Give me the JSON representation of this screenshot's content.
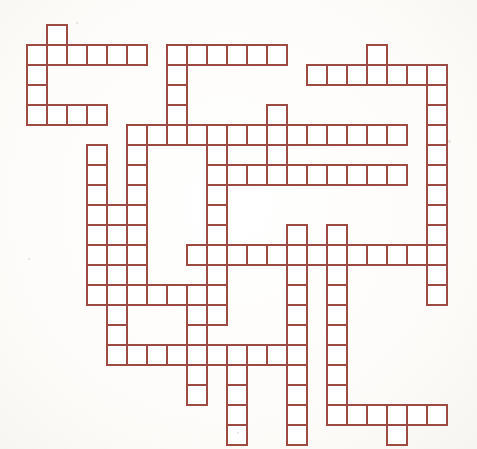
{
  "puzzle": {
    "title": "Crossword Grid",
    "type": "blank-crossword-grid",
    "description": "Empty crossword puzzle skeleton of interlocking word slots",
    "background_color": "#fdfdfb",
    "cell_fill_color": "#ffffff",
    "line_color": "#9c4a42",
    "line_width_px": 1.4,
    "cell_size_px": 20,
    "origin_x_px": 27,
    "origin_y_px": 25,
    "columns": 22,
    "rows": 21,
    "total_cells": 268,
    "cells": [
      [
        1,
        0
      ],
      [
        0,
        1
      ],
      [
        1,
        1
      ],
      [
        2,
        1
      ],
      [
        3,
        1
      ],
      [
        4,
        1
      ],
      [
        5,
        1
      ],
      [
        7,
        1
      ],
      [
        8,
        1
      ],
      [
        9,
        1
      ],
      [
        10,
        1
      ],
      [
        11,
        1
      ],
      [
        12,
        1
      ],
      [
        17,
        1
      ],
      [
        0,
        2
      ],
      [
        7,
        2
      ],
      [
        14,
        2
      ],
      [
        15,
        2
      ],
      [
        16,
        2
      ],
      [
        17,
        2
      ],
      [
        18,
        2
      ],
      [
        19,
        2
      ],
      [
        20,
        2
      ],
      [
        0,
        3
      ],
      [
        7,
        3
      ],
      [
        20,
        3
      ],
      [
        0,
        4
      ],
      [
        1,
        4
      ],
      [
        2,
        4
      ],
      [
        3,
        4
      ],
      [
        7,
        4
      ],
      [
        12,
        4
      ],
      [
        20,
        4
      ],
      [
        5,
        5
      ],
      [
        6,
        5
      ],
      [
        7,
        5
      ],
      [
        8,
        5
      ],
      [
        9,
        5
      ],
      [
        10,
        5
      ],
      [
        11,
        5
      ],
      [
        12,
        5
      ],
      [
        13,
        5
      ],
      [
        14,
        5
      ],
      [
        15,
        5
      ],
      [
        16,
        5
      ],
      [
        17,
        5
      ],
      [
        18,
        5
      ],
      [
        20,
        5
      ],
      [
        3,
        6
      ],
      [
        5,
        6
      ],
      [
        9,
        6
      ],
      [
        12,
        6
      ],
      [
        20,
        6
      ],
      [
        3,
        7
      ],
      [
        5,
        7
      ],
      [
        9,
        7
      ],
      [
        10,
        7
      ],
      [
        11,
        7
      ],
      [
        12,
        7
      ],
      [
        13,
        7
      ],
      [
        14,
        7
      ],
      [
        15,
        7
      ],
      [
        16,
        7
      ],
      [
        17,
        7
      ],
      [
        18,
        7
      ],
      [
        20,
        7
      ],
      [
        3,
        8
      ],
      [
        5,
        8
      ],
      [
        9,
        8
      ],
      [
        20,
        8
      ],
      [
        3,
        9
      ],
      [
        4,
        9
      ],
      [
        5,
        9
      ],
      [
        9,
        9
      ],
      [
        20,
        9
      ],
      [
        3,
        10
      ],
      [
        4,
        10
      ],
      [
        5,
        10
      ],
      [
        9,
        10
      ],
      [
        13,
        10
      ],
      [
        15,
        10
      ],
      [
        20,
        10
      ],
      [
        3,
        11
      ],
      [
        4,
        11
      ],
      [
        5,
        11
      ],
      [
        8,
        11
      ],
      [
        9,
        11
      ],
      [
        10,
        11
      ],
      [
        11,
        11
      ],
      [
        12,
        11
      ],
      [
        13,
        11
      ],
      [
        14,
        11
      ],
      [
        15,
        11
      ],
      [
        16,
        11
      ],
      [
        17,
        11
      ],
      [
        18,
        11
      ],
      [
        19,
        11
      ],
      [
        20,
        11
      ],
      [
        3,
        12
      ],
      [
        4,
        12
      ],
      [
        5,
        12
      ],
      [
        9,
        12
      ],
      [
        13,
        12
      ],
      [
        15,
        12
      ],
      [
        20,
        12
      ],
      [
        3,
        13
      ],
      [
        4,
        13
      ],
      [
        5,
        13
      ],
      [
        6,
        13
      ],
      [
        7,
        13
      ],
      [
        8,
        13
      ],
      [
        9,
        13
      ],
      [
        13,
        13
      ],
      [
        15,
        13
      ],
      [
        20,
        13
      ],
      [
        4,
        14
      ],
      [
        8,
        14
      ],
      [
        9,
        14
      ],
      [
        13,
        14
      ],
      [
        15,
        14
      ],
      [
        4,
        15
      ],
      [
        8,
        15
      ],
      [
        13,
        15
      ],
      [
        15,
        15
      ],
      [
        4,
        16
      ],
      [
        5,
        16
      ],
      [
        6,
        16
      ],
      [
        7,
        16
      ],
      [
        8,
        16
      ],
      [
        9,
        16
      ],
      [
        10,
        16
      ],
      [
        11,
        16
      ],
      [
        12,
        16
      ],
      [
        13,
        16
      ],
      [
        15,
        16
      ],
      [
        8,
        17
      ],
      [
        10,
        17
      ],
      [
        13,
        17
      ],
      [
        15,
        17
      ],
      [
        8,
        18
      ],
      [
        10,
        18
      ],
      [
        13,
        18
      ],
      [
        15,
        18
      ],
      [
        10,
        19
      ],
      [
        13,
        19
      ],
      [
        15,
        19
      ],
      [
        16,
        19
      ],
      [
        17,
        19
      ],
      [
        18,
        19
      ],
      [
        19,
        19
      ],
      [
        20,
        19
      ],
      [
        10,
        20
      ],
      [
        13,
        20
      ],
      [
        18,
        20
      ]
    ]
  }
}
